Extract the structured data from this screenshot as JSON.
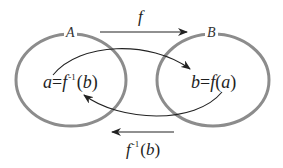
{
  "diagram": {
    "type": "function-inverse-mapping",
    "colors": {
      "set_outline": "#8c8c8c",
      "arrow": "#222222",
      "text": "#1e1e1e",
      "background": "#ffffff"
    },
    "sets": [
      {
        "name": "A",
        "label": "A"
      },
      {
        "name": "B",
        "label": "B"
      }
    ],
    "elements": {
      "left": {
        "lhs": "a",
        "eq": "=",
        "fn": "f",
        "sup": "-1",
        "open": "(",
        "arg": "b",
        "close": ")"
      },
      "right": {
        "lhs": "b",
        "eq": "=",
        "fn": "f",
        "open": "(",
        "arg": "a",
        "close": ")"
      }
    },
    "arrows": {
      "top_straight": {
        "label": "f",
        "direction": "A-to-B"
      },
      "bottom_straight": {
        "label_fn": "f",
        "label_sup": "-1",
        "label_open": "(",
        "label_arg": "b",
        "label_close": ")",
        "direction": "B-to-A"
      },
      "curve_upper": {
        "from": "a",
        "to": "b"
      },
      "curve_lower": {
        "from": "b",
        "to": "a"
      }
    }
  }
}
